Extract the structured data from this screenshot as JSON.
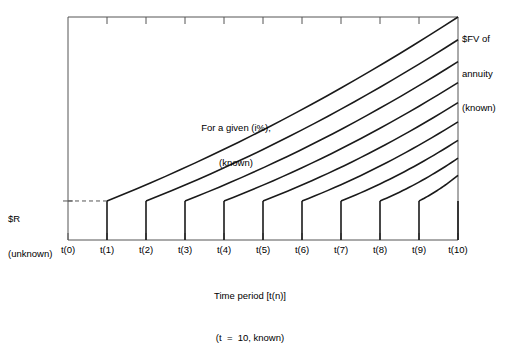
{
  "chart_data": {
    "type": "line",
    "title": "",
    "xlabel": "Time period [t(n)]",
    "xlabel_sub": "(t  =  10, known)",
    "ylabel": "",
    "grid": false,
    "legend": "none",
    "categories": [
      "t(0)",
      "t(1)",
      "t(2)",
      "t(3)",
      "t(4)",
      "t(5)",
      "t(6)",
      "t(7)",
      "t(8)",
      "t(9)",
      "t(10)"
    ],
    "x": [
      0,
      1,
      2,
      3,
      4,
      5,
      6,
      7,
      8,
      9,
      10
    ],
    "xlim": [
      0,
      10
    ],
    "ylim": [
      0,
      1
    ],
    "deposit_level_label": "$R",
    "deposit_level_sublabel": "(unknown)",
    "deposit_value": 0.175,
    "terminal_label": "$FV of",
    "terminal_label_2": "annuity",
    "terminal_label_3": "(known)",
    "annotation_line1": "For a given (i%),",
    "annotation_line2": "(known)",
    "series": [
      {
        "name": "deposit-t1",
        "start_period": 1,
        "start_value": 0.175,
        "end_value": 1.0
      },
      {
        "name": "deposit-t2",
        "start_period": 2,
        "start_value": 0.175,
        "end_value": 0.898
      },
      {
        "name": "deposit-t3",
        "start_period": 3,
        "start_value": 0.175,
        "end_value": 0.8
      },
      {
        "name": "deposit-t4",
        "start_period": 4,
        "start_value": 0.175,
        "end_value": 0.706
      },
      {
        "name": "deposit-t5",
        "start_period": 5,
        "start_value": 0.175,
        "end_value": 0.616
      },
      {
        "name": "deposit-t6",
        "start_period": 6,
        "start_value": 0.175,
        "end_value": 0.53
      },
      {
        "name": "deposit-t7",
        "start_period": 7,
        "start_value": 0.175,
        "end_value": 0.447
      },
      {
        "name": "deposit-t8",
        "start_period": 8,
        "start_value": 0.175,
        "end_value": 0.367
      },
      {
        "name": "deposit-t9",
        "start_period": 9,
        "start_value": 0.175,
        "end_value": 0.29
      },
      {
        "name": "deposit-t10",
        "start_period": 10,
        "start_value": 0.175,
        "end_value": 0.175
      }
    ]
  },
  "axis": {
    "caption_line1": "Time period [t(n)]",
    "caption_line2": "(t  =  10, known)"
  },
  "colors": {
    "line": "#1a1a1a",
    "frame": "#555555",
    "dashed": "#555555",
    "background": "#ffffff"
  }
}
